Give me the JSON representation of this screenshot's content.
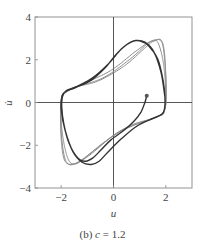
{
  "chart_data": {
    "type": "line",
    "title": "",
    "caption": {
      "prefix": "(b) ",
      "var": "c",
      "rest": " = 1.2"
    },
    "xlabel": "u",
    "ylabel": "u̇",
    "xlim": [
      -3,
      3
    ],
    "ylim": [
      -4,
      4
    ],
    "xticks": [
      -2,
      0,
      2
    ],
    "xtick_labels": [
      "−2",
      "0",
      "2"
    ],
    "yticks": [
      -4,
      -2,
      0,
      2,
      4
    ],
    "ytick_labels": [
      "−4",
      "−2",
      "0",
      "2",
      "4"
    ],
    "grid": false,
    "zero_lines": true,
    "legend": null,
    "start_point": {
      "u": 1.27,
      "v": 0.32
    },
    "series": [
      {
        "name": "limit cycle",
        "style": "solid-dark",
        "points": [
          [
            1.27,
            0.32
          ],
          [
            1.2,
            0.0
          ],
          [
            1.05,
            -0.45
          ],
          [
            0.8,
            -0.85
          ],
          [
            0.4,
            -1.3
          ],
          [
            -0.1,
            -1.75
          ],
          [
            -0.5,
            -2.25
          ],
          [
            -0.8,
            -2.6
          ],
          [
            -1.1,
            -2.75
          ],
          [
            -1.4,
            -2.55
          ],
          [
            -1.7,
            -1.9
          ],
          [
            -1.9,
            -1.0
          ],
          [
            -1.98,
            -0.2
          ],
          [
            -1.95,
            0.3
          ],
          [
            -1.8,
            0.55
          ],
          [
            -1.4,
            0.75
          ],
          [
            -0.8,
            1.15
          ],
          [
            -0.2,
            1.8
          ],
          [
            0.3,
            2.5
          ],
          [
            0.7,
            2.85
          ],
          [
            1.0,
            2.88
          ],
          [
            1.35,
            2.65
          ],
          [
            1.7,
            2.0
          ],
          [
            1.9,
            1.0
          ],
          [
            1.97,
            0.2
          ],
          [
            1.95,
            -0.3
          ],
          [
            1.85,
            -0.55
          ],
          [
            1.5,
            -0.75
          ],
          [
            0.9,
            -1.1
          ],
          [
            0.3,
            -1.7
          ],
          [
            -0.2,
            -2.3
          ],
          [
            -0.55,
            -2.75
          ],
          [
            -0.85,
            -2.9
          ],
          [
            -1.2,
            -2.8
          ],
          [
            -1.55,
            -2.3
          ],
          [
            -1.85,
            -1.3
          ],
          [
            -2.0,
            -0.3
          ],
          [
            -1.97,
            0.3
          ],
          [
            -1.82,
            0.52
          ],
          [
            -1.45,
            0.7
          ],
          [
            -0.85,
            1.05
          ],
          [
            -0.3,
            1.65
          ],
          [
            0.1,
            2.25
          ],
          [
            0.5,
            2.7
          ],
          [
            0.85,
            2.9
          ],
          [
            1.2,
            2.82
          ],
          [
            1.55,
            2.35
          ],
          [
            1.82,
            1.4
          ],
          [
            1.96,
            0.3
          ]
        ]
      },
      {
        "name": "transient 1",
        "style": "dotted-gray",
        "points": [
          [
            -1.95,
            0.35
          ],
          [
            -1.5,
            0.7
          ],
          [
            -0.6,
            1.0
          ],
          [
            0.4,
            1.7
          ],
          [
            1.2,
            2.55
          ],
          [
            1.5,
            2.85
          ],
          [
            1.7,
            2.8
          ],
          [
            1.9,
            1.9
          ],
          [
            2.0,
            0.5
          ],
          [
            1.95,
            -0.35
          ],
          [
            1.6,
            -0.7
          ],
          [
            0.6,
            -1.1
          ],
          [
            -0.4,
            -1.9
          ],
          [
            -1.1,
            -2.6
          ],
          [
            -1.5,
            -2.88
          ],
          [
            -1.75,
            -2.6
          ],
          [
            -1.95,
            -1.5
          ],
          [
            -2.02,
            -0.2
          ],
          [
            -1.95,
            0.35
          ]
        ]
      },
      {
        "name": "transient 2",
        "style": "dotted-gray",
        "points": [
          [
            -1.95,
            0.4
          ],
          [
            -1.4,
            0.75
          ],
          [
            -0.4,
            1.15
          ],
          [
            0.6,
            2.0
          ],
          [
            1.3,
            2.75
          ],
          [
            1.6,
            2.9
          ],
          [
            1.85,
            2.85
          ],
          [
            1.98,
            1.6
          ],
          [
            2.02,
            0.3
          ],
          [
            1.9,
            -0.45
          ],
          [
            1.4,
            -0.8
          ],
          [
            0.3,
            -1.3
          ],
          [
            -0.7,
            -2.2
          ],
          [
            -1.3,
            -2.75
          ],
          [
            -1.7,
            -2.9
          ],
          [
            -1.9,
            -2.4
          ],
          [
            -2.02,
            -1.0
          ],
          [
            -2.0,
            0.1
          ],
          [
            -1.95,
            0.4
          ]
        ]
      },
      {
        "name": "transient 3",
        "style": "dotted-gray",
        "points": [
          [
            -1.9,
            0.45
          ],
          [
            -1.2,
            0.85
          ],
          [
            -0.1,
            1.5
          ],
          [
            0.8,
            2.35
          ],
          [
            1.4,
            2.85
          ],
          [
            1.8,
            2.9
          ],
          [
            1.95,
            2.3
          ],
          [
            2.0,
            0.8
          ],
          [
            1.95,
            -0.4
          ],
          [
            1.7,
            -0.65
          ],
          [
            0.9,
            -1.0
          ],
          [
            0.0,
            -1.55
          ],
          [
            -0.9,
            -2.45
          ],
          [
            -1.45,
            -2.85
          ],
          [
            -1.85,
            -2.75
          ],
          [
            -2.0,
            -1.7
          ],
          [
            -2.0,
            -0.2
          ],
          [
            -1.9,
            0.45
          ]
        ]
      }
    ]
  }
}
